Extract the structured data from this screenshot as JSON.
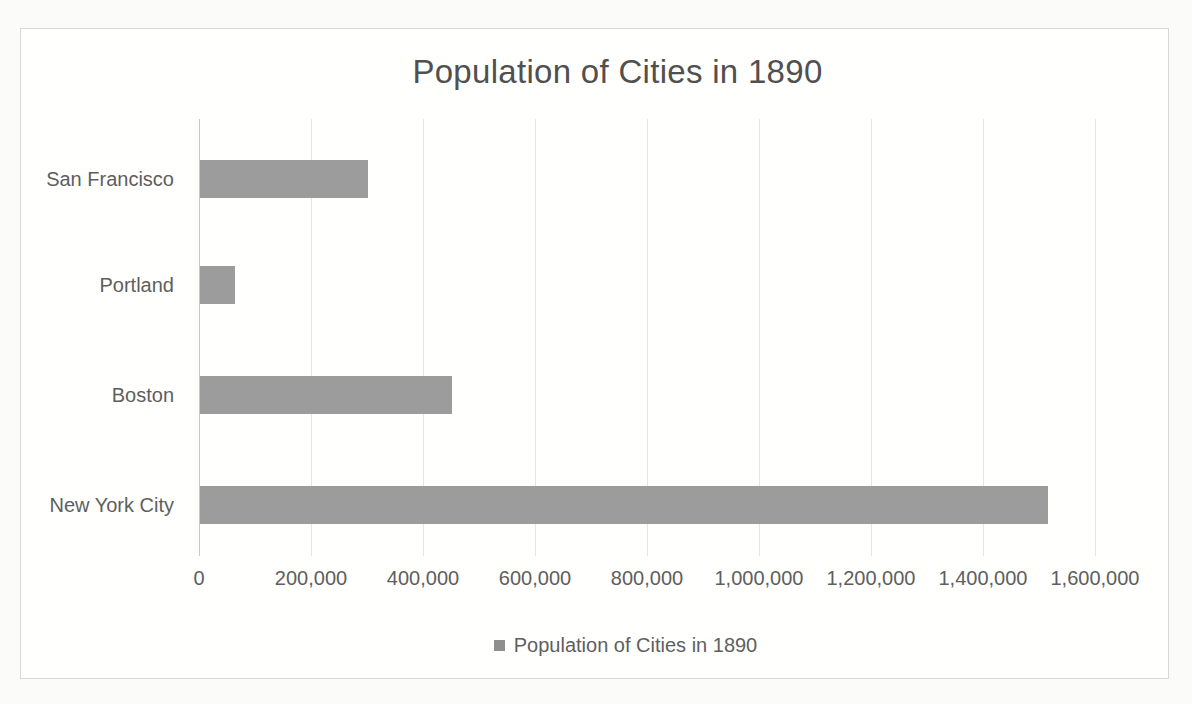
{
  "chart": {
    "legend": {
      "label": "Population of Cities in 1890",
      "marker_color": "#8f8f8f"
    },
    "colors": {
      "bar": "#9c9c9c",
      "title_text": "#505050",
      "label_text": "#5e5e5e",
      "gridline": "#e5e5e3",
      "axis_line": "#c9c9c7",
      "frame_border": "#d8d8d5"
    }
  },
  "chart_data": {
    "type": "bar",
    "orientation": "horizontal",
    "title": "Population of Cities in 1890",
    "categories": [
      "San Francisco",
      "Portland",
      "Boston",
      "New York City"
    ],
    "values": [
      300000,
      62000,
      450000,
      1515000
    ],
    "series": [
      {
        "name": "Population of Cities in 1890",
        "values": [
          300000,
          62000,
          450000,
          1515000
        ]
      }
    ],
    "xlabel": "",
    "ylabel": "",
    "xlim": [
      0,
      1600000
    ],
    "x_tick_interval": 200000,
    "x_tick_labels": [
      "0",
      "200,000",
      "400,000",
      "600,000",
      "800,000",
      "1,000,000",
      "1,200,000",
      "1,400,000",
      "1,600,000"
    ],
    "grid": "vertical-major",
    "legend_position": "bottom"
  }
}
